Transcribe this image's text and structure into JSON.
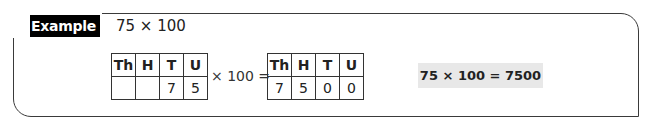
{
  "example": {
    "label": "Example",
    "prompt": "75 × 100"
  },
  "place_value_before": {
    "headers": [
      "Th",
      "H",
      "T",
      "U"
    ],
    "values": [
      "",
      "",
      "7",
      "5"
    ]
  },
  "operator_text": "× 100 =",
  "place_value_after": {
    "headers": [
      "Th",
      "H",
      "T",
      "U"
    ],
    "values": [
      "7",
      "5",
      "0",
      "0"
    ]
  },
  "answer": "75 × 100 = 7500",
  "colors": {
    "label_bg": "#000000",
    "label_text": "#ffffff",
    "answer_bg": "#e8e8e8",
    "border": "#3a3a3a"
  }
}
